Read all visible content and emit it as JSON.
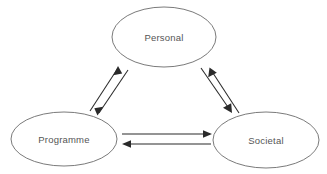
{
  "diagram": {
    "background_color": "#ffffff",
    "node_stroke_color": "#6b6b6b",
    "node_fill_color": "#ffffff",
    "label_color": "#555555",
    "arrow_color": "#2a2a2a",
    "nodes": [
      {
        "id": "personal",
        "label": "Personal",
        "cx": 164,
        "cy": 37,
        "rx": 52,
        "ry": 30
      },
      {
        "id": "programme",
        "label": "Programme",
        "cx": 64,
        "cy": 139,
        "rx": 53,
        "ry": 27
      },
      {
        "id": "societal",
        "label": "Societal",
        "cx": 266,
        "cy": 140,
        "rx": 53,
        "ry": 28
      }
    ],
    "connections": [
      {
        "id": "programme-to-personal",
        "from": "Programme",
        "to": "Personal",
        "direction": "up-right",
        "arrow_label": "arrow-up-right"
      },
      {
        "id": "personal-to-programme",
        "from": "Personal",
        "to": "Programme",
        "direction": "down-left",
        "arrow_label": "arrow-down-left"
      },
      {
        "id": "societal-to-personal",
        "from": "Societal",
        "to": "Personal",
        "direction": "up-left",
        "arrow_label": "arrow-up-left"
      },
      {
        "id": "personal-to-societal",
        "from": "Personal",
        "to": "Societal",
        "direction": "down-right",
        "arrow_label": "arrow-down-right"
      },
      {
        "id": "programme-to-societal",
        "from": "Programme",
        "to": "Societal",
        "direction": "right",
        "arrow_label": "arrow-right"
      },
      {
        "id": "societal-to-programme",
        "from": "Societal",
        "to": "Programme",
        "direction": "left",
        "arrow_label": "arrow-left"
      }
    ]
  }
}
